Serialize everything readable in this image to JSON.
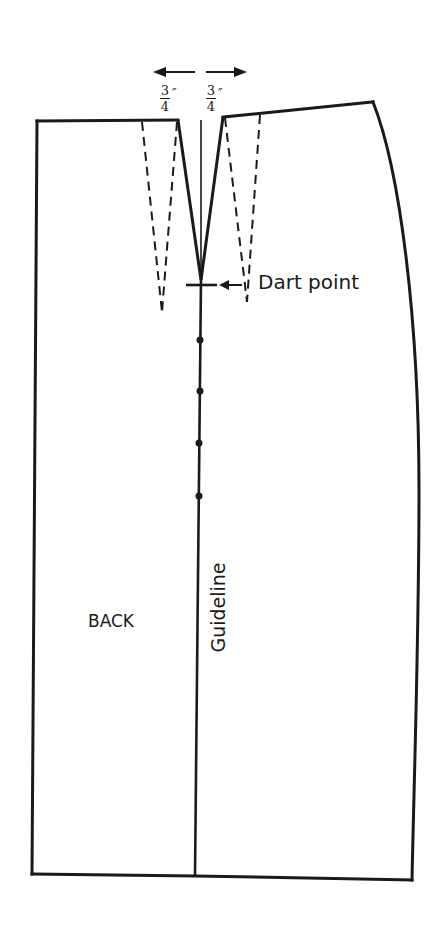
{
  "diagram": {
    "labels": {
      "dart_point": "Dart point",
      "back": "BACK",
      "guideline": "Guideline"
    },
    "measurements": {
      "left": {
        "numerator": "3",
        "denominator": "4",
        "unit": "″"
      },
      "right": {
        "numerator": "3",
        "denominator": "4",
        "unit": "″"
      }
    },
    "guideline_marks": 4,
    "colors": {
      "ink": "#1a1a1a",
      "background": "#ffffff"
    }
  }
}
